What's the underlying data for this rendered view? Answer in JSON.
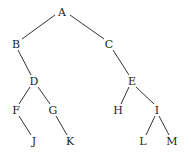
{
  "diagram": {
    "type": "binary-tree",
    "nodes": [
      {
        "id": "A",
        "label": "A",
        "x": 62,
        "y": 12
      },
      {
        "id": "B",
        "label": "B",
        "x": 16,
        "y": 44
      },
      {
        "id": "C",
        "label": "C",
        "x": 109,
        "y": 44
      },
      {
        "id": "D",
        "label": "D",
        "x": 34,
        "y": 81
      },
      {
        "id": "E",
        "label": "E",
        "x": 132,
        "y": 81
      },
      {
        "id": "F",
        "label": "F",
        "x": 16,
        "y": 110
      },
      {
        "id": "G",
        "label": "G",
        "x": 53,
        "y": 110
      },
      {
        "id": "H",
        "label": "H",
        "x": 118,
        "y": 110
      },
      {
        "id": "I",
        "label": "I",
        "x": 157,
        "y": 110
      },
      {
        "id": "J",
        "label": "J",
        "x": 34,
        "y": 141
      },
      {
        "id": "K",
        "label": "K",
        "x": 70,
        "y": 141
      },
      {
        "id": "L",
        "label": "L",
        "x": 143,
        "y": 141
      },
      {
        "id": "M",
        "label": "M",
        "x": 172,
        "y": 141
      }
    ],
    "edges": [
      {
        "from": "A",
        "to": "B",
        "x1": 55,
        "y1": 15,
        "x2": 22,
        "y2": 39
      },
      {
        "from": "A",
        "to": "C",
        "x1": 70,
        "y1": 15,
        "x2": 104,
        "y2": 39
      },
      {
        "from": "B",
        "to": "D",
        "x1": 18,
        "y1": 50,
        "x2": 31,
        "y2": 75
      },
      {
        "from": "C",
        "to": "E",
        "x1": 113,
        "y1": 50,
        "x2": 129,
        "y2": 75
      },
      {
        "from": "D",
        "to": "F",
        "x1": 30,
        "y1": 87,
        "x2": 19,
        "y2": 104
      },
      {
        "from": "D",
        "to": "G",
        "x1": 38,
        "y1": 87,
        "x2": 50,
        "y2": 104
      },
      {
        "from": "E",
        "to": "H",
        "x1": 129,
        "y1": 87,
        "x2": 121,
        "y2": 104
      },
      {
        "from": "E",
        "to": "I",
        "x1": 136,
        "y1": 87,
        "x2": 154,
        "y2": 104
      },
      {
        "from": "F",
        "to": "J",
        "x1": 19,
        "y1": 116,
        "x2": 31,
        "y2": 135
      },
      {
        "from": "G",
        "to": "K",
        "x1": 56,
        "y1": 116,
        "x2": 67,
        "y2": 135
      },
      {
        "from": "I",
        "to": "L",
        "x1": 155,
        "y1": 116,
        "x2": 146,
        "y2": 135
      },
      {
        "from": "I",
        "to": "M",
        "x1": 159,
        "y1": 116,
        "x2": 169,
        "y2": 135
      }
    ]
  }
}
